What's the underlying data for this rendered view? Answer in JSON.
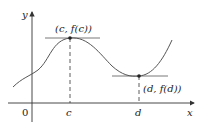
{
  "diagram": {
    "title": "",
    "axes": {
      "x_label": "x",
      "y_label": "y",
      "origin_label": "0"
    },
    "points": [
      {
        "name": "max",
        "label": "(c, f(c))",
        "tick": "c"
      },
      {
        "name": "min",
        "label": "(d, f(d))",
        "tick": "d"
      }
    ],
    "colors": {
      "stroke": "#333333",
      "curve": "#555555",
      "background": "#ffffff"
    }
  }
}
